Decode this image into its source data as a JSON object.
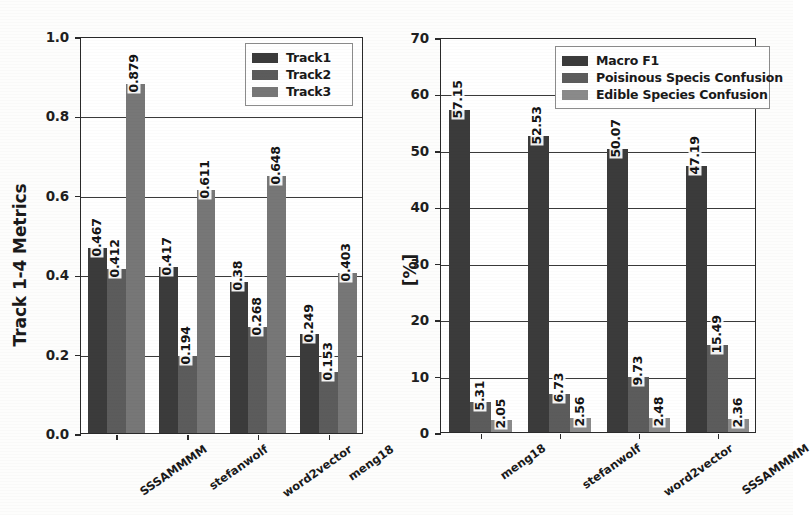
{
  "figure": {
    "background_color": "#fdfdfc",
    "panels": [
      "left",
      "right"
    ]
  },
  "chart_data": [
    {
      "id": "left",
      "type": "bar",
      "title": "",
      "xlabel": "",
      "ylabel": "Track 1-4 Metrics",
      "ylim": [
        0.0,
        1.0
      ],
      "yticks": [
        "0.0",
        "0.2",
        "0.4",
        "0.6",
        "0.8",
        "1.0"
      ],
      "ytick_values": [
        0.0,
        0.2,
        0.4,
        0.6,
        0.8,
        1.0
      ],
      "grid": true,
      "legend_position": "upper right",
      "categories": [
        "SSSAMMMM",
        "stefanwolf",
        "word2vector",
        "meng18"
      ],
      "series": [
        {
          "name": "Track1",
          "color": "#3b3b3b",
          "values": [
            0.467,
            0.417,
            0.38,
            0.249
          ]
        },
        {
          "name": "Track2",
          "color": "#5c5c5c",
          "values": [
            0.412,
            0.194,
            0.268,
            0.153
          ]
        },
        {
          "name": "Track3",
          "color": "#777777",
          "values": [
            0.879,
            0.611,
            0.648,
            0.403
          ]
        }
      ],
      "bar_labels": [
        [
          "0.467",
          "0.412",
          "0.879"
        ],
        [
          "0.417",
          "0.194",
          "0.611"
        ],
        [
          "0.38",
          "0.268",
          "0.648"
        ],
        [
          "0.249",
          "0.153",
          "0.403"
        ]
      ]
    },
    {
      "id": "right",
      "type": "bar",
      "title": "",
      "xlabel": "",
      "ylabel": "[%]",
      "ylim": [
        0,
        70
      ],
      "yticks": [
        "0",
        "10",
        "20",
        "30",
        "40",
        "50",
        "60",
        "70"
      ],
      "ytick_values": [
        0,
        10,
        20,
        30,
        40,
        50,
        60,
        70
      ],
      "grid": true,
      "legend_position": "upper center",
      "categories": [
        "meng18",
        "stefanwolf",
        "word2vector",
        "SSSAMMMM"
      ],
      "series": [
        {
          "name": "Macro F1",
          "color": "#3b3b3b",
          "values": [
            57.15,
            52.53,
            50.07,
            47.19
          ]
        },
        {
          "name": "Poisinous Specis Confusion",
          "color": "#5c5c5c",
          "values": [
            5.31,
            6.73,
            9.73,
            15.49
          ]
        },
        {
          "name": "Edible Species Confusion",
          "color": "#8a8a8a",
          "values": [
            2.05,
            2.56,
            2.48,
            2.36
          ]
        }
      ],
      "bar_labels": [
        [
          "57.15",
          "5.31",
          "2.05"
        ],
        [
          "52.53",
          "6.73",
          "2.56"
        ],
        [
          "50.07",
          "9.73",
          "2.48"
        ],
        [
          "47.19",
          "15.49",
          "2.36"
        ]
      ]
    }
  ]
}
